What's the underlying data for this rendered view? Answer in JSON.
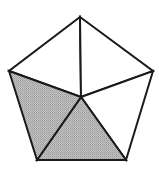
{
  "diagram": {
    "type": "pentagon-divided-into-triangles",
    "colors": {
      "background": "#ffffff",
      "stroke": "#1a1a1a",
      "shaded_fill": "#b3b3b3",
      "unshaded_fill": "#ffffff"
    },
    "stroke_width": 2,
    "vertices": {
      "top": [
        80,
        17
      ],
      "right": [
        153,
        71
      ],
      "bottom_right": [
        126,
        160
      ],
      "bottom_left": [
        37,
        160
      ],
      "left": [
        9,
        71
      ],
      "center": [
        81,
        97
      ]
    },
    "triangles": [
      {
        "id": "top-left",
        "points": [
          "top",
          "center",
          "left"
        ],
        "shaded": false
      },
      {
        "id": "top-right",
        "points": [
          "top",
          "right",
          "center"
        ],
        "shaded": false
      },
      {
        "id": "right-bottom",
        "points": [
          "right",
          "bottom_right",
          "center"
        ],
        "shaded": false
      },
      {
        "id": "bottom",
        "points": [
          "bottom_right",
          "bottom_left",
          "center"
        ],
        "shaded": true
      },
      {
        "id": "left-bottom",
        "points": [
          "bottom_left",
          "left",
          "center"
        ],
        "shaded": true
      }
    ],
    "shaded_count": 2,
    "total_count": 5
  }
}
